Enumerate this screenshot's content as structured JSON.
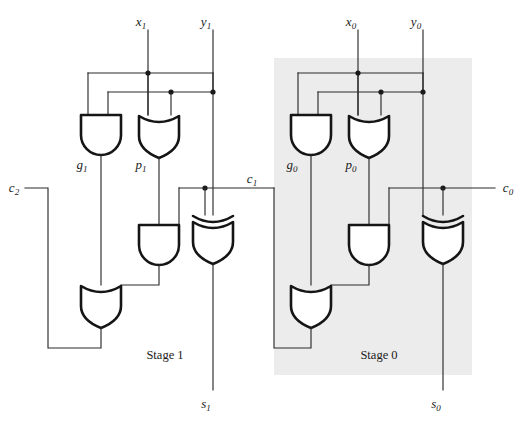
{
  "figure": {
    "background_color": "#ffffff",
    "wire_color": "#2b2b2b",
    "gate_outline_color": "#151515",
    "stage0_shade_color": "#ececec",
    "width": 529,
    "height": 421
  },
  "labels": {
    "x1": "x",
    "x1_sub": "1",
    "y1": "y",
    "y1_sub": "1",
    "x0": "x",
    "x0_sub": "0",
    "y0": "y",
    "y0_sub": "0",
    "g1": "g",
    "g1_sub": "1",
    "p1": "p",
    "p1_sub": "1",
    "g0": "g",
    "g0_sub": "0",
    "p0": "p",
    "p0_sub": "0",
    "c2": "c",
    "c2_sub": "2",
    "c1": "c",
    "c1_sub": "1",
    "c0": "c",
    "c0_sub": "0",
    "s1": "s",
    "s1_sub": "1",
    "s0": "s",
    "s0_sub": "0",
    "stage1": "Stage 1",
    "stage0": "Stage 0"
  },
  "gates": {
    "stage1": [
      {
        "name": "and-gate-g1",
        "type": "AND",
        "output_label": "g1"
      },
      {
        "name": "or-gate-p1",
        "type": "OR",
        "output_label": "p1"
      },
      {
        "name": "and-gate-carry-1",
        "type": "AND",
        "output_label": ""
      },
      {
        "name": "xor-gate-sum-1",
        "type": "XOR",
        "output_label": "s1"
      },
      {
        "name": "or-gate-carry-out-1",
        "type": "OR",
        "output_label": "c2"
      }
    ],
    "stage0": [
      {
        "name": "and-gate-g0",
        "type": "AND",
        "output_label": "g0"
      },
      {
        "name": "or-gate-p0",
        "type": "OR",
        "output_label": "p0"
      },
      {
        "name": "and-gate-carry-0",
        "type": "AND",
        "output_label": ""
      },
      {
        "name": "xor-gate-sum-0",
        "type": "XOR",
        "output_label": "s0"
      },
      {
        "name": "or-gate-carry-out-0",
        "type": "OR",
        "output_label": "c1"
      }
    ]
  },
  "signals": {
    "inputs_top": [
      "x1",
      "y1",
      "x0",
      "y0"
    ],
    "carry_in": "c0",
    "carry_intermediate": "c1",
    "carry_out": "c2",
    "outputs_bottom": [
      "s1",
      "s0"
    ]
  }
}
